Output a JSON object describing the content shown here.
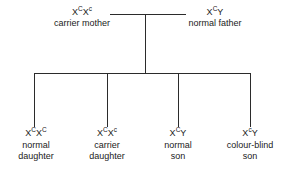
{
  "diagram": {
    "type": "pedigree",
    "line_color": "#2b2b2b",
    "background_color": "#ffffff",
    "generations": 2
  },
  "parents": [
    {
      "role": "mother",
      "genotype_base_1": "X",
      "genotype_sup_1": "C",
      "genotype_base_2": "X",
      "genotype_sup_2": "c",
      "genotype_text": "XCXc",
      "description": "carrier mother"
    },
    {
      "role": "father",
      "genotype_base_1": "X",
      "genotype_sup_1": "C",
      "genotype_base_2": "Y",
      "genotype_sup_2": "",
      "genotype_text": "XCY",
      "description": "normal father"
    }
  ],
  "children": [
    {
      "role": "daughter",
      "genotype_base_1": "X",
      "genotype_sup_1": "C",
      "genotype_base_2": "X",
      "genotype_sup_2": "C",
      "genotype_text": "XCXC",
      "description_line_1": "normal",
      "description_line_2": "daughter"
    },
    {
      "role": "daughter",
      "genotype_base_1": "X",
      "genotype_sup_1": "C",
      "genotype_base_2": "X",
      "genotype_sup_2": "c",
      "genotype_text": "XCXc",
      "description_line_1": "carrier",
      "description_line_2": "daughter"
    },
    {
      "role": "son",
      "genotype_base_1": "X",
      "genotype_sup_1": "C",
      "genotype_base_2": "Y",
      "genotype_sup_2": "",
      "genotype_text": "XCY",
      "description_line_1": "normal",
      "description_line_2": "son"
    },
    {
      "role": "son",
      "genotype_base_1": "X",
      "genotype_sup_1": "c",
      "genotype_base_2": "Y",
      "genotype_sup_2": "",
      "genotype_text": "XcY",
      "description_line_1": "colour-blind",
      "description_line_2": "son"
    }
  ]
}
